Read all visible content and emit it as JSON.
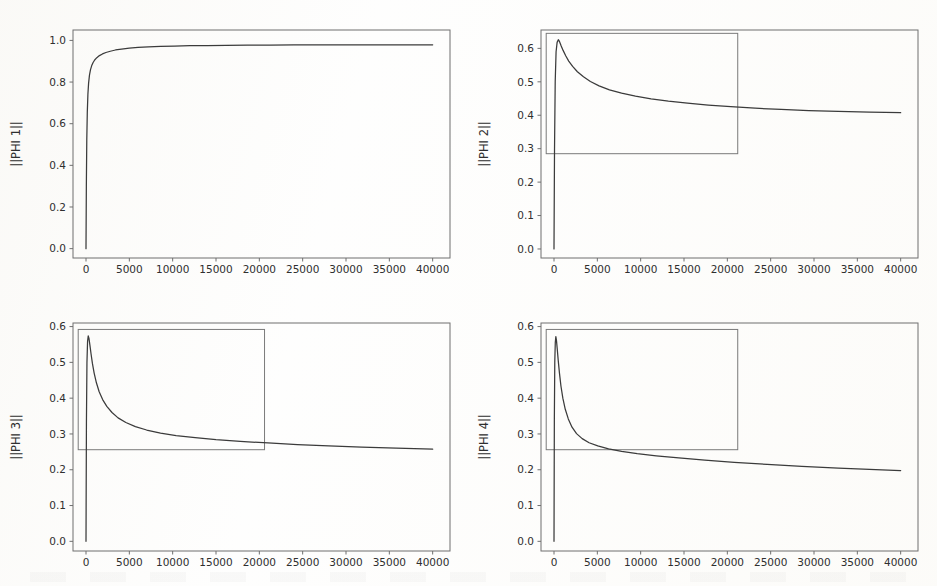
{
  "figure": {
    "background_color": "#fdfdfc",
    "line_color": "#3b3b3b",
    "frame_color": "#6f6f6f",
    "overlay_color": "#7a7a7a",
    "layout": "2x2 grid"
  },
  "chart_data": [
    {
      "type": "line",
      "panel_id": "panel-1",
      "title": "",
      "xlabel": "",
      "ylabel": "||PHI 1||",
      "xlim": [
        -1500,
        42000
      ],
      "ylim": [
        -0.045,
        1.05
      ],
      "xticks": [
        0,
        5000,
        10000,
        15000,
        20000,
        25000,
        30000,
        35000,
        40000
      ],
      "xticklabels": [
        "0",
        "5000",
        "10000",
        "15000",
        "20000",
        "25000",
        "30000",
        "35000",
        "40000"
      ],
      "yticks": [
        0.0,
        0.2,
        0.4,
        0.6,
        0.8,
        1.0
      ],
      "yticklabels": [
        "0.0",
        "0.2",
        "0.4",
        "0.6",
        "0.8",
        "1.0"
      ],
      "grid": false,
      "legend": null,
      "annotations": [],
      "overlay_rect": null,
      "x": [
        0,
        40,
        90,
        150,
        220,
        300,
        400,
        520,
        660,
        820,
        1000,
        1250,
        1550,
        1900,
        2300,
        2800,
        3400,
        4100,
        5000,
        6000,
        7200,
        8600,
        10200,
        12000,
        14000,
        16200,
        18600,
        21200,
        24000,
        27000,
        30200,
        33600,
        36800,
        40000
      ],
      "y": [
        0.0,
        0.3,
        0.52,
        0.655,
        0.742,
        0.795,
        0.833,
        0.86,
        0.879,
        0.894,
        0.906,
        0.917,
        0.927,
        0.935,
        0.942,
        0.948,
        0.954,
        0.958,
        0.963,
        0.966,
        0.969,
        0.971,
        0.973,
        0.9745,
        0.9755,
        0.9763,
        0.977,
        0.9775,
        0.978,
        0.9783,
        0.9786,
        0.9788,
        0.9789,
        0.979
      ]
    },
    {
      "type": "line",
      "panel_id": "panel-2",
      "title": "",
      "xlabel": "",
      "ylabel": "||PHI 2||",
      "xlim": [
        -1500,
        42000
      ],
      "ylim": [
        -0.027,
        0.655
      ],
      "xticks": [
        0,
        5000,
        10000,
        15000,
        20000,
        25000,
        30000,
        35000,
        40000
      ],
      "xticklabels": [
        "0",
        "5000",
        "10000",
        "15000",
        "20000",
        "25000",
        "30000",
        "35000",
        "40000"
      ],
      "yticks": [
        0.0,
        0.1,
        0.2,
        0.3,
        0.4,
        0.5,
        0.6
      ],
      "yticklabels": [
        "0.0",
        "0.1",
        "0.2",
        "0.3",
        "0.4",
        "0.5",
        "0.6"
      ],
      "grid": false,
      "legend": null,
      "annotations": [],
      "overlay_rect": {
        "x0": -900,
        "x1": 21200,
        "y0": 0.285,
        "y1": 0.645
      },
      "x": [
        0,
        60,
        140,
        240,
        360,
        500,
        640,
        820,
        1050,
        1350,
        1700,
        2150,
        2700,
        3400,
        4200,
        5200,
        6400,
        7800,
        9400,
        11200,
        13200,
        15400,
        17800,
        20400,
        23200,
        26200,
        29400,
        32800,
        36400,
        40000
      ],
      "y": [
        0.0,
        0.3,
        0.5,
        0.59,
        0.618,
        0.626,
        0.62,
        0.608,
        0.594,
        0.578,
        0.562,
        0.546,
        0.53,
        0.515,
        0.501,
        0.488,
        0.476,
        0.466,
        0.457,
        0.449,
        0.442,
        0.436,
        0.4305,
        0.4255,
        0.421,
        0.4175,
        0.414,
        0.4113,
        0.409,
        0.4075
      ]
    },
    {
      "type": "line",
      "panel_id": "panel-3",
      "title": "",
      "xlabel": "",
      "ylabel": "||PHI 3||",
      "xlim": [
        -1500,
        42000
      ],
      "ylim": [
        -0.027,
        0.61
      ],
      "xticks": [
        0,
        5000,
        10000,
        15000,
        20000,
        25000,
        30000,
        35000,
        40000
      ],
      "xticklabels": [
        "0",
        "5000",
        "10000",
        "15000",
        "20000",
        "25000",
        "30000",
        "35000",
        "40000"
      ],
      "yticks": [
        0.0,
        0.1,
        0.2,
        0.3,
        0.4,
        0.5,
        0.6
      ],
      "yticklabels": [
        "0.0",
        "0.1",
        "0.2",
        "0.3",
        "0.4",
        "0.5",
        "0.6"
      ],
      "grid": false,
      "legend": null,
      "annotations": [],
      "overlay_rect": {
        "x0": -900,
        "x1": 20600,
        "y0": 0.256,
        "y1": 0.592
      },
      "x": [
        0,
        50,
        110,
        180,
        260,
        350,
        450,
        580,
        740,
        940,
        1200,
        1520,
        1920,
        2400,
        3000,
        3700,
        4600,
        5700,
        7000,
        8600,
        10400,
        12600,
        15000,
        17800,
        21000,
        24400,
        28000,
        31800,
        35800,
        40000
      ],
      "y": [
        0.0,
        0.33,
        0.5,
        0.558,
        0.574,
        0.566,
        0.548,
        0.524,
        0.497,
        0.47,
        0.443,
        0.418,
        0.396,
        0.377,
        0.36,
        0.345,
        0.332,
        0.3205,
        0.311,
        0.3025,
        0.2955,
        0.2895,
        0.284,
        0.2795,
        0.2748,
        0.2705,
        0.2668,
        0.2635,
        0.2605,
        0.2575
      ]
    },
    {
      "type": "line",
      "panel_id": "panel-4",
      "title": "",
      "xlabel": "",
      "ylabel": "||PHI 4||",
      "xlim": [
        -1500,
        42000
      ],
      "ylim": [
        -0.027,
        0.61
      ],
      "xticks": [
        0,
        5000,
        10000,
        15000,
        20000,
        25000,
        30000,
        35000,
        40000
      ],
      "xticklabels": [
        "0",
        "5000",
        "10000",
        "15000",
        "20000",
        "25000",
        "30000",
        "35000",
        "40000"
      ],
      "yticks": [
        0.0,
        0.1,
        0.2,
        0.3,
        0.4,
        0.5,
        0.6
      ],
      "yticklabels": [
        "0.0",
        "0.1",
        "0.2",
        "0.3",
        "0.4",
        "0.5",
        "0.6"
      ],
      "grid": false,
      "legend": null,
      "annotations": [],
      "overlay_rect": {
        "x0": -900,
        "x1": 21200,
        "y0": 0.256,
        "y1": 0.592
      },
      "x": [
        0,
        40,
        90,
        150,
        215,
        290,
        380,
        490,
        630,
        800,
        1020,
        1300,
        1650,
        2080,
        2600,
        3250,
        4050,
        5050,
        6300,
        7800,
        9600,
        11800,
        14400,
        17400,
        20800,
        24600,
        28600,
        32800,
        36400,
        40000
      ],
      "y": [
        0.0,
        0.34,
        0.5,
        0.556,
        0.572,
        0.56,
        0.536,
        0.505,
        0.47,
        0.434,
        0.4,
        0.369,
        0.342,
        0.319,
        0.301,
        0.287,
        0.2755,
        0.2665,
        0.2585,
        0.2515,
        0.2452,
        0.239,
        0.233,
        0.2268,
        0.2208,
        0.2148,
        0.2092,
        0.2045,
        0.2012,
        0.1978
      ]
    }
  ]
}
